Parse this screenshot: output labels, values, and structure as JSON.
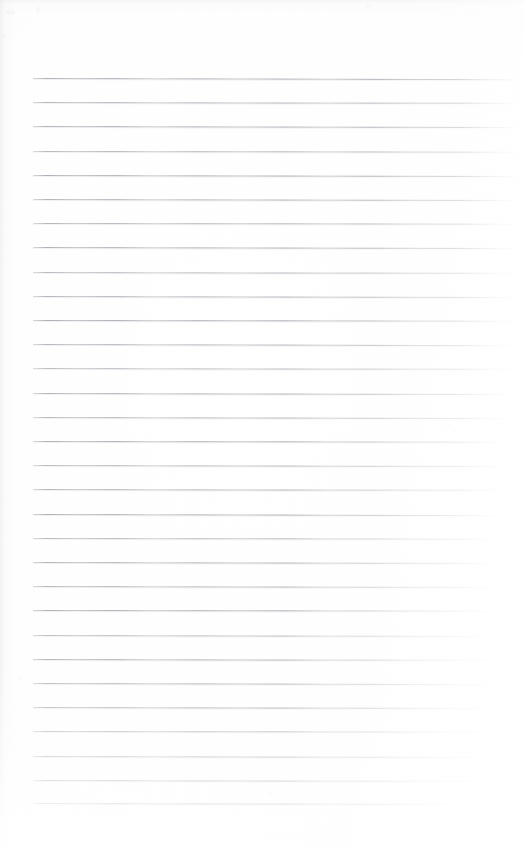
{
  "document": {
    "kind": "scanned-ruled-paper",
    "title": "Blank lined notebook page",
    "page_width": 524,
    "page_height": 864,
    "content_text": "",
    "has_handwriting": false,
    "has_printed_text": false
  },
  "paper": {
    "background_color": "#fdfdfd",
    "tint_color": "#fcfcfb",
    "edge_shadow_color": "#d6d6d6",
    "grain_opacity": 0.32
  },
  "rules": {
    "count": 31,
    "line_color": "#a4a4ad",
    "halo_color": "#cdcdd3",
    "thickness_px": 1,
    "spacing_px": 24.2,
    "first_line_y": 78,
    "last_line_y": 803,
    "left_x": 33,
    "right_x": 516,
    "lines": [
      {
        "y": 78.0,
        "left": 33,
        "right": 516,
        "tilt_deg": 0.14,
        "opacity": 0.92
      },
      {
        "y": 102.2,
        "left": 33,
        "right": 516,
        "tilt_deg": 0.1,
        "opacity": 0.86
      },
      {
        "y": 126.4,
        "left": 33,
        "right": 515,
        "tilt_deg": 0.13,
        "opacity": 0.9
      },
      {
        "y": 150.6,
        "left": 33,
        "right": 516,
        "tilt_deg": 0.08,
        "opacity": 0.82
      },
      {
        "y": 174.8,
        "left": 33,
        "right": 516,
        "tilt_deg": 0.12,
        "opacity": 0.94
      },
      {
        "y": 199.0,
        "left": 33,
        "right": 515,
        "tilt_deg": 0.11,
        "opacity": 0.88
      },
      {
        "y": 223.2,
        "left": 33,
        "right": 516,
        "tilt_deg": 0.09,
        "opacity": 0.84
      },
      {
        "y": 247.4,
        "left": 33,
        "right": 516,
        "tilt_deg": 0.13,
        "opacity": 0.91
      },
      {
        "y": 271.6,
        "left": 33,
        "right": 515,
        "tilt_deg": 0.1,
        "opacity": 0.8
      },
      {
        "y": 295.8,
        "left": 33,
        "right": 516,
        "tilt_deg": 0.12,
        "opacity": 0.87
      },
      {
        "y": 320.0,
        "left": 33,
        "right": 516,
        "tilt_deg": 0.08,
        "opacity": 0.93
      },
      {
        "y": 344.2,
        "left": 33,
        "right": 515,
        "tilt_deg": 0.14,
        "opacity": 0.85
      },
      {
        "y": 368.4,
        "left": 33,
        "right": 516,
        "tilt_deg": 0.1,
        "opacity": 0.78
      },
      {
        "y": 392.6,
        "left": 33,
        "right": 516,
        "tilt_deg": 0.11,
        "opacity": 0.89
      },
      {
        "y": 416.8,
        "left": 33,
        "right": 515,
        "tilt_deg": 0.13,
        "opacity": 0.83
      },
      {
        "y": 441.0,
        "left": 33,
        "right": 516,
        "tilt_deg": 0.09,
        "opacity": 0.9
      },
      {
        "y": 465.2,
        "left": 33,
        "right": 516,
        "tilt_deg": 0.12,
        "opacity": 0.81
      },
      {
        "y": 489.4,
        "left": 33,
        "right": 515,
        "tilt_deg": 0.1,
        "opacity": 0.86
      },
      {
        "y": 513.6,
        "left": 33,
        "right": 516,
        "tilt_deg": 0.14,
        "opacity": 0.92
      },
      {
        "y": 537.8,
        "left": 33,
        "right": 516,
        "tilt_deg": 0.08,
        "opacity": 0.79
      },
      {
        "y": 562.0,
        "left": 33,
        "right": 515,
        "tilt_deg": 0.11,
        "opacity": 0.88
      },
      {
        "y": 586.2,
        "left": 33,
        "right": 516,
        "tilt_deg": 0.13,
        "opacity": 0.84
      },
      {
        "y": 610.4,
        "left": 33,
        "right": 516,
        "tilt_deg": 0.09,
        "opacity": 0.91
      },
      {
        "y": 634.6,
        "left": 33,
        "right": 515,
        "tilt_deg": 0.12,
        "opacity": 0.77
      },
      {
        "y": 658.8,
        "left": 33,
        "right": 516,
        "tilt_deg": 0.1,
        "opacity": 0.87
      },
      {
        "y": 683.0,
        "left": 33,
        "right": 516,
        "tilt_deg": 0.14,
        "opacity": 0.82
      },
      {
        "y": 707.2,
        "left": 33,
        "right": 515,
        "tilt_deg": 0.11,
        "opacity": 0.89
      },
      {
        "y": 731.4,
        "left": 33,
        "right": 516,
        "tilt_deg": 0.09,
        "opacity": 0.8
      },
      {
        "y": 755.6,
        "left": 33,
        "right": 516,
        "tilt_deg": 0.13,
        "opacity": 0.86
      },
      {
        "y": 779.8,
        "left": 33,
        "right": 515,
        "tilt_deg": 0.1,
        "opacity": 0.93
      },
      {
        "y": 803.0,
        "left": 33,
        "right": 516,
        "tilt_deg": 0.12,
        "opacity": 0.88
      }
    ]
  },
  "specks": [
    {
      "x": 6,
      "y": 10,
      "w": 9,
      "h": 5,
      "opacity": 0.3
    },
    {
      "x": 36,
      "y": 6,
      "w": 4,
      "h": 7,
      "opacity": 0.26
    },
    {
      "x": 2,
      "y": 34,
      "w": 5,
      "h": 4,
      "opacity": 0.22
    },
    {
      "x": 366,
      "y": 4,
      "w": 6,
      "h": 4,
      "opacity": 0.18
    },
    {
      "x": 446,
      "y": 424,
      "w": 5,
      "h": 3,
      "opacity": 0.28
    },
    {
      "x": 18,
      "y": 676,
      "w": 4,
      "h": 4,
      "opacity": 0.2
    },
    {
      "x": 268,
      "y": 792,
      "w": 6,
      "h": 3,
      "opacity": 0.24
    },
    {
      "x": 310,
      "y": 836,
      "w": 7,
      "h": 4,
      "opacity": 0.19
    },
    {
      "x": 58,
      "y": 848,
      "w": 5,
      "h": 4,
      "opacity": 0.16
    }
  ]
}
